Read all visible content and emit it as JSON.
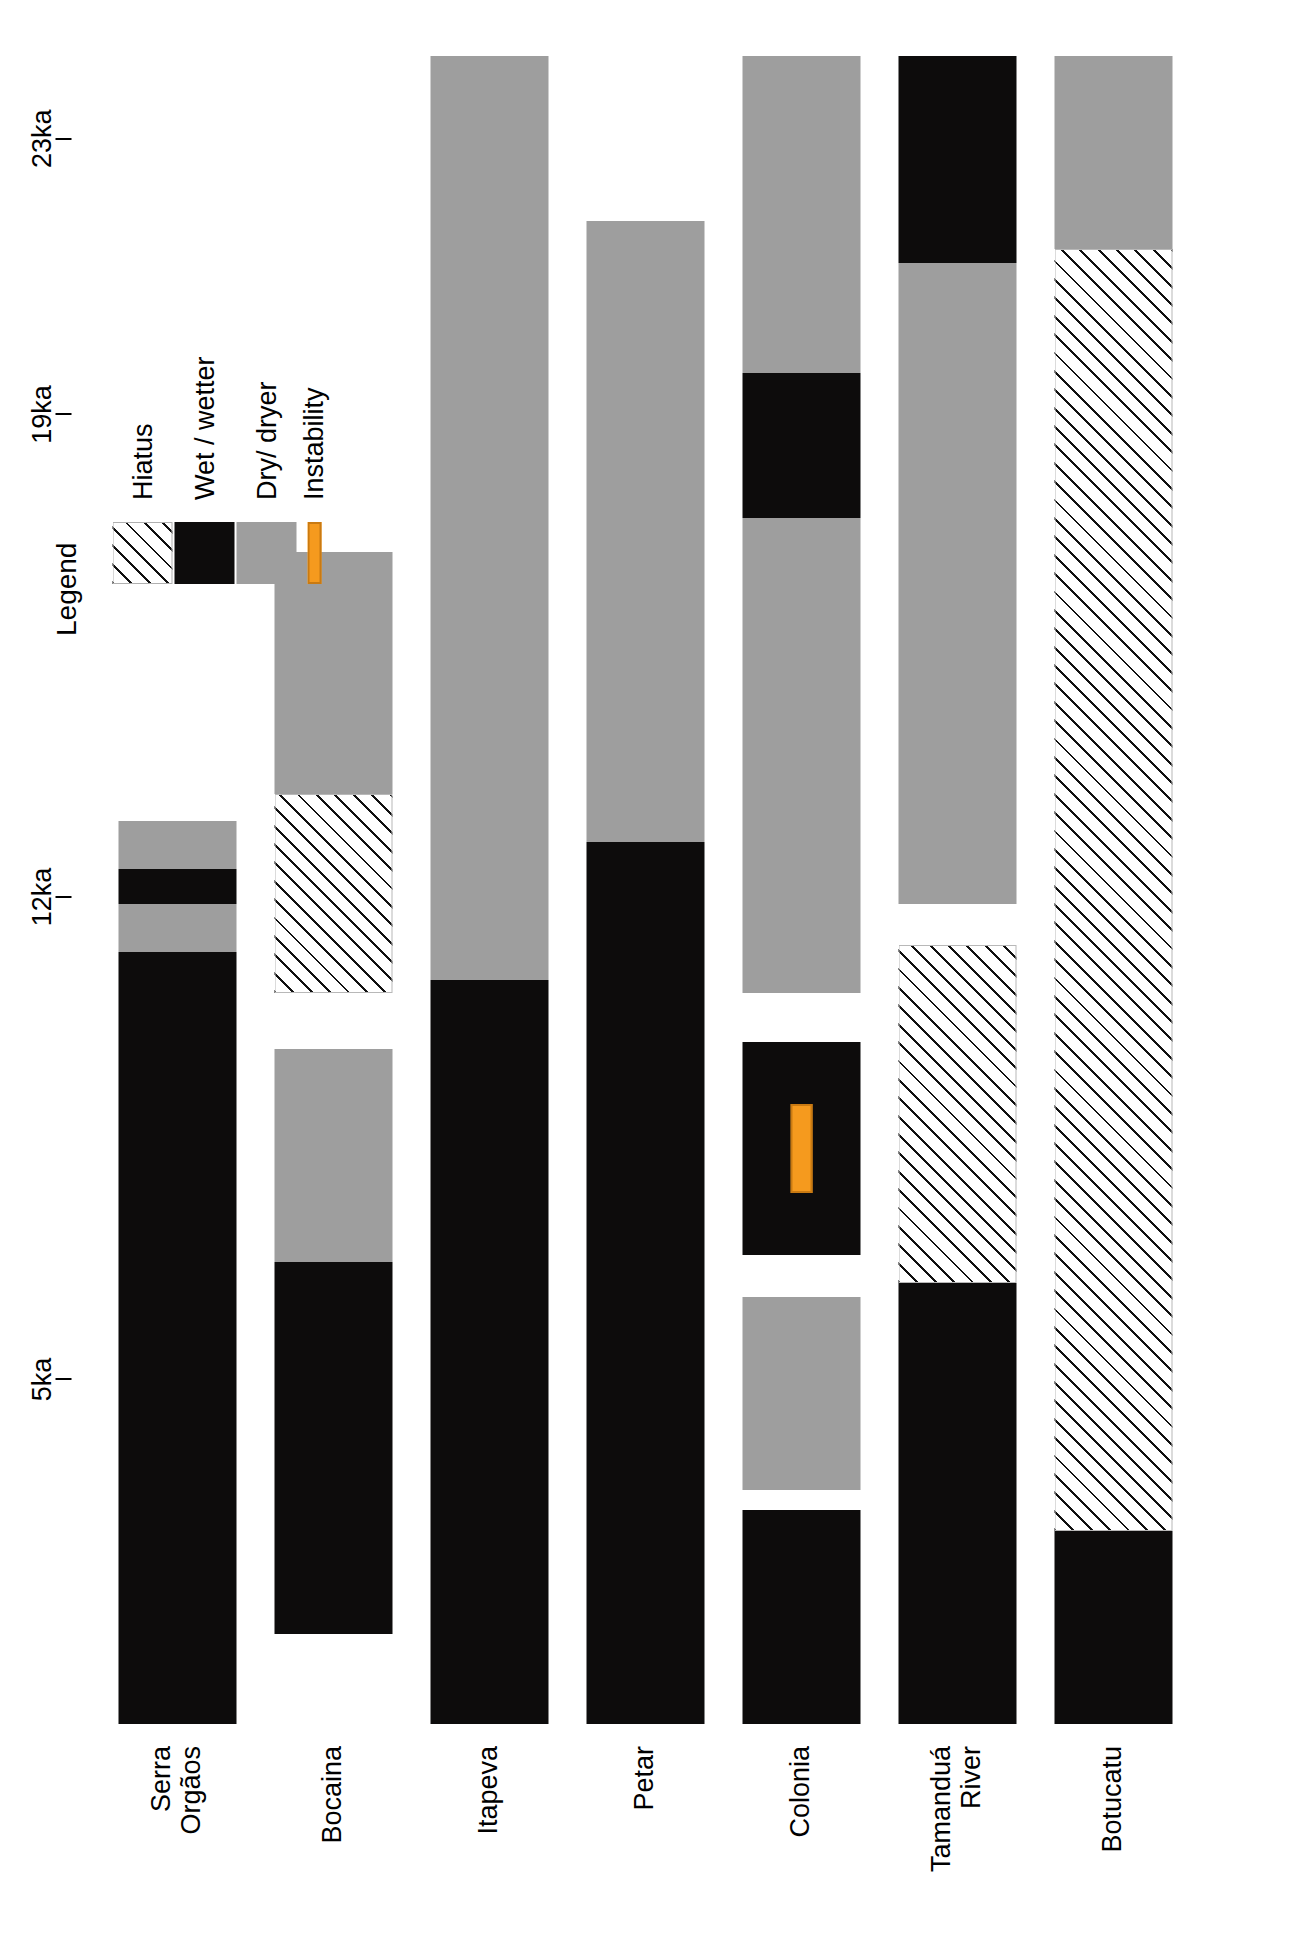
{
  "figure": {
    "orientation": "rotated-90-ccw",
    "background": "#ffffff"
  },
  "legend": {
    "title": "Legend",
    "items": [
      {
        "key": "hiatus",
        "label": "Hiatus",
        "color": "#ffffff",
        "pattern": "diagonal-hatch"
      },
      {
        "key": "wet",
        "label": "Wet / wetter",
        "color": "#0d0c0c",
        "pattern": "solid"
      },
      {
        "key": "dry",
        "label": "Dry/ dryer",
        "color": "#9e9e9e",
        "pattern": "solid"
      },
      {
        "key": "instability",
        "label": "Instability",
        "color": "#f59a1e",
        "pattern": "solid-bar"
      }
    ]
  },
  "axis": {
    "label": "",
    "unit": "ka",
    "ticks": [
      {
        "value": 5,
        "label": "5ka"
      },
      {
        "value": 12,
        "label": "12ka"
      },
      {
        "value": 19,
        "label": "19ka"
      },
      {
        "value": 23,
        "label": "23ka"
      }
    ],
    "range": [
      0,
      24.2
    ]
  },
  "chart_data": {
    "type": "bar",
    "title": "",
    "xlabel": "",
    "ylabel": "Age (ka)",
    "ylim": [
      0,
      24.2
    ],
    "categories": [
      "Serra\nOrgãos",
      "Bocaina",
      "Itapeva",
      "Petar",
      "Colonia",
      "Tamanduá\nRiver",
      "Botucatu"
    ],
    "legend_position": "top-right",
    "grid": false,
    "series": [
      {
        "name": "Serra Orgãos",
        "segments": [
          {
            "type": "wet",
            "start": 0.0,
            "end": 11.2
          },
          {
            "type": "dry",
            "start": 11.2,
            "end": 11.9
          },
          {
            "type": "wet",
            "start": 11.9,
            "end": 12.4
          },
          {
            "type": "dry",
            "start": 12.4,
            "end": 13.1
          }
        ]
      },
      {
        "name": "Bocaina",
        "segments": [
          {
            "type": "blank",
            "start": 0.0,
            "end": 1.3
          },
          {
            "type": "wet",
            "start": 1.3,
            "end": 6.7
          },
          {
            "type": "dry",
            "start": 6.7,
            "end": 9.8
          },
          {
            "type": "blank",
            "start": 9.8,
            "end": 10.6
          },
          {
            "type": "hiatus",
            "start": 10.6,
            "end": 13.5
          },
          {
            "type": "dry",
            "start": 13.5,
            "end": 17.0
          },
          {
            "type": "blank",
            "start": 17.0,
            "end": 24.2
          }
        ]
      },
      {
        "name": "Itapeva",
        "segments": [
          {
            "type": "wet",
            "start": 0.0,
            "end": 10.8
          },
          {
            "type": "dry",
            "start": 10.8,
            "end": 24.2
          }
        ]
      },
      {
        "name": "Petar",
        "segments": [
          {
            "type": "wet",
            "start": 0.0,
            "end": 12.8
          },
          {
            "type": "dry",
            "start": 12.8,
            "end": 21.8
          }
        ]
      },
      {
        "name": "Colonia",
        "segments": [
          {
            "type": "wet",
            "start": 0.0,
            "end": 3.1
          },
          {
            "type": "blank",
            "start": 3.1,
            "end": 3.4
          },
          {
            "type": "dry",
            "start": 3.4,
            "end": 6.2
          },
          {
            "type": "blank",
            "start": 6.2,
            "end": 6.8
          },
          {
            "type": "wet",
            "start": 6.8,
            "end": 9.9
          },
          {
            "type": "blank",
            "start": 9.9,
            "end": 10.6
          },
          {
            "type": "dry",
            "start": 10.6,
            "end": 17.5
          },
          {
            "type": "wet",
            "start": 17.5,
            "end": 19.6
          },
          {
            "type": "dry",
            "start": 19.6,
            "end": 24.2
          }
        ],
        "markers": [
          {
            "type": "instability",
            "start": 7.7,
            "end": 9.0
          }
        ]
      },
      {
        "name": "Tamanduá River",
        "segments": [
          {
            "type": "wet",
            "start": 0.0,
            "end": 6.4
          },
          {
            "type": "hiatus",
            "start": 6.4,
            "end": 11.3
          },
          {
            "type": "blank",
            "start": 11.3,
            "end": 11.9
          },
          {
            "type": "dry",
            "start": 11.9,
            "end": 21.2
          },
          {
            "type": "wet",
            "start": 21.2,
            "end": 24.2
          }
        ]
      },
      {
        "name": "Botucatu",
        "segments": [
          {
            "type": "wet",
            "start": 0.0,
            "end": 2.8
          },
          {
            "type": "hiatus",
            "start": 2.8,
            "end": 21.4
          },
          {
            "type": "dry",
            "start": 21.4,
            "end": 24.2
          }
        ]
      }
    ]
  }
}
